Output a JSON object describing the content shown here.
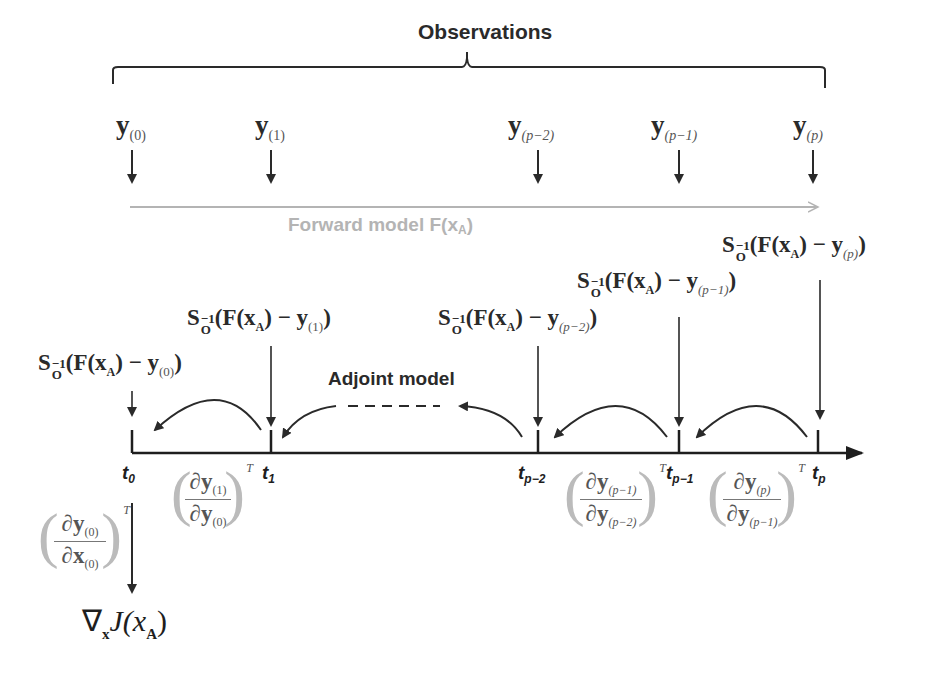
{
  "title": "Observations",
  "observations": [
    {
      "symbol": "y",
      "index": "(0)"
    },
    {
      "symbol": "y",
      "index": "(1)"
    },
    {
      "symbol": "y",
      "index": "(p−2)"
    },
    {
      "symbol": "y",
      "index": "(p−1)"
    },
    {
      "symbol": "y",
      "index": "(p)"
    }
  ],
  "forward_model": {
    "label": "Forward model F(x",
    "sub": "A",
    "close": ")"
  },
  "adjoint_model": {
    "label": "Adjoint model"
  },
  "innovations": [
    {
      "lead": "S",
      "sup": "−1",
      "sub": "O",
      "body": "(F(x",
      "xsub": "A",
      "mid": ") − y",
      "ysub": "(0)",
      "close": ")"
    },
    {
      "lead": "S",
      "sup": "−1",
      "sub": "O",
      "body": "(F(x",
      "xsub": "A",
      "mid": ") − y",
      "ysub": "(1)",
      "close": ")"
    },
    {
      "lead": "S",
      "sup": "−1",
      "sub": "O",
      "body": "(F(x",
      "xsub": "A",
      "mid": ") − y",
      "ysub": "(p−2)",
      "close": ")"
    },
    {
      "lead": "S",
      "sup": "−1",
      "sub": "O",
      "body": "(F(x",
      "xsub": "A",
      "mid": ") − y",
      "ysub": "(p−1)",
      "close": ")"
    },
    {
      "lead": "S",
      "sup": "−1",
      "sub": "O",
      "body": "(F(x",
      "xsub": "A",
      "mid": ") − y",
      "ysub": "(p)",
      "close": ")"
    }
  ],
  "time_labels": [
    {
      "t": "t",
      "sub": "0"
    },
    {
      "t": "t",
      "sub": "1"
    },
    {
      "t": "t",
      "sub": "p−2"
    },
    {
      "t": "t",
      "sub": "p−1"
    },
    {
      "t": "t",
      "sub": "p"
    }
  ],
  "jacobians": [
    {
      "num": "∂y",
      "num_sub": "(0)",
      "den": "∂x",
      "den_sub": "(0)",
      "sup": "T"
    },
    {
      "num": "∂y",
      "num_sub": "(1)",
      "den": "∂y",
      "den_sub": "(0)",
      "sup": "T"
    },
    {
      "num": "∂y",
      "num_sub": "(p−1)",
      "den": "∂y",
      "den_sub": "(p−2)",
      "sup": "T"
    },
    {
      "num": "∂y",
      "num_sub": "(p)",
      "den": "∂y",
      "den_sub": "(p−1)",
      "sup": "T"
    }
  ],
  "gradient": {
    "nabla": "∇",
    "nabla_sub": "x",
    "func": "J(x",
    "xsub": "A",
    "close": ")"
  },
  "colors": {
    "ink": "#2a2a2a",
    "forward": "#b4b4b4",
    "jacobian": "#555555"
  }
}
